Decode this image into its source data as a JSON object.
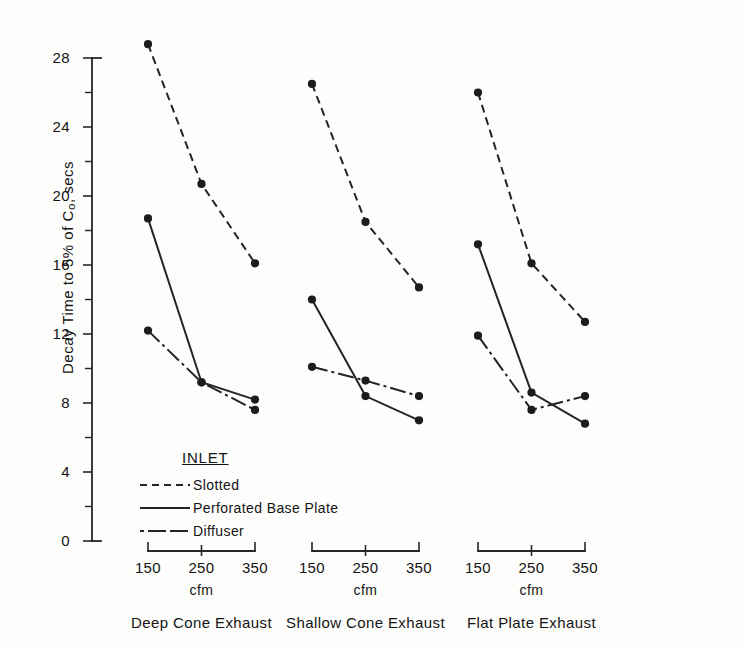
{
  "chart_data": {
    "type": "line",
    "title": "",
    "ylabel": "Decay Time to 5% of C0, secs",
    "ylabel_prefix": "Decay Time to 5% of C",
    "ylabel_sub": "o",
    "ylabel_suffix": ", secs",
    "xlabel": "cfm",
    "ylim": [
      0,
      28
    ],
    "ytick_labels": [
      "28",
      "24",
      "20",
      "16",
      "12",
      "8",
      "4",
      "0"
    ],
    "ytick_values": [
      28,
      24,
      20,
      16,
      12,
      8,
      4,
      0
    ],
    "yminor_step": 2,
    "grid": false,
    "categories": [
      "150",
      "250",
      "350"
    ],
    "x": [
      150,
      250,
      350
    ],
    "legend": {
      "title": "INLET",
      "position": "inside-lower-left",
      "entries": [
        {
          "name": "Slotted",
          "style": "dashed"
        },
        {
          "name": "Perforated Base Plate",
          "style": "solid"
        },
        {
          "name": "Diffuser",
          "style": "dash-dot"
        }
      ]
    },
    "panels": [
      {
        "title": "Deep Cone Exhaust",
        "xlabel": "cfm",
        "series": [
          {
            "name": "Slotted",
            "style": "dashed",
            "values": [
              28.8,
              20.7,
              16.1
            ]
          },
          {
            "name": "Perforated Base Plate",
            "style": "solid",
            "values": [
              18.7,
              9.2,
              8.2
            ]
          },
          {
            "name": "Diffuser",
            "style": "dash-dot",
            "values": [
              12.2,
              9.2,
              7.6
            ]
          }
        ]
      },
      {
        "title": "Shallow Cone Exhaust",
        "xlabel": "cfm",
        "series": [
          {
            "name": "Slotted",
            "style": "dashed",
            "values": [
              26.5,
              18.5,
              14.7
            ]
          },
          {
            "name": "Perforated Base Plate",
            "style": "solid",
            "values": [
              14.0,
              8.4,
              7.0
            ]
          },
          {
            "name": "Diffuser",
            "style": "dash-dot",
            "values": [
              10.1,
              9.3,
              8.4
            ]
          }
        ]
      },
      {
        "title": "Flat Plate Exhaust",
        "xlabel": "cfm",
        "series": [
          {
            "name": "Slotted",
            "style": "dashed",
            "values": [
              26.0,
              16.1,
              12.7
            ]
          },
          {
            "name": "Perforated Base Plate",
            "style": "solid",
            "values": [
              17.2,
              8.6,
              6.8
            ]
          },
          {
            "name": "Diffuser",
            "style": "dash-dot",
            "values": [
              11.9,
              7.6,
              8.4
            ]
          }
        ]
      }
    ],
    "colors": {
      "ink": "#242424",
      "background": "#fdfdfc"
    }
  }
}
